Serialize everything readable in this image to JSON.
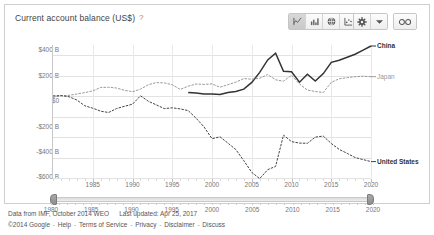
{
  "header": {
    "chart_title": "Current account balance (US$)",
    "help_icon": "question-mark-icon",
    "toolbar": {
      "chart_types": [
        {
          "name": "line-chart-icon",
          "label": "Line chart",
          "selected": true
        },
        {
          "name": "bar-chart-icon",
          "label": "Bar chart",
          "selected": false
        },
        {
          "name": "map-chart-icon",
          "label": "Map",
          "selected": false
        },
        {
          "name": "scatter-chart-icon",
          "label": "Scatter chart",
          "selected": false
        }
      ],
      "settings_icon": "gear-icon",
      "settings_caret": "chevron-down-icon",
      "link_icon": "link-icon"
    }
  },
  "chart_data": {
    "type": "line",
    "title": "Current account balance (US$)",
    "xlabel": "",
    "ylabel": "",
    "xlim": [
      1980,
      2020
    ],
    "ylim": [
      -800,
      500
    ],
    "grid": true,
    "legend_position": "right-inline",
    "y_ticks": [
      "$400 B",
      "$200 B",
      "$0",
      "-$200 B",
      "-$400 B",
      "-$600 B",
      "-$800 B"
    ],
    "y_tick_values": [
      400,
      200,
      0,
      -200,
      -400,
      -600,
      -800
    ],
    "x_ticks": [
      "1985",
      "1990",
      "1995",
      "2000",
      "2005",
      "2010",
      "2015",
      "2020"
    ],
    "x_tick_values": [
      1985,
      1990,
      1995,
      2000,
      2005,
      2010,
      2015,
      2020
    ],
    "unit": "US$ billions",
    "series": [
      {
        "name": "China",
        "color": "#333333",
        "style": "solid",
        "label_bold": true,
        "x": [
          1997,
          1998,
          1999,
          2000,
          2001,
          2002,
          2003,
          2004,
          2005,
          2006,
          2007,
          2008,
          2009,
          2010,
          2011,
          2012,
          2013,
          2014,
          2015,
          2016,
          2017,
          2018,
          2019,
          2020
        ],
        "values": [
          37,
          31,
          21,
          21,
          17,
          35,
          46,
          69,
          134,
          232,
          354,
          420,
          243,
          238,
          136,
          215,
          148,
          220,
          330,
          350,
          380,
          410,
          450,
          490
        ]
      },
      {
        "name": "Japan",
        "color": "#999999",
        "style": "dashed",
        "label_bold": false,
        "x": [
          1980,
          1981,
          1982,
          1983,
          1984,
          1985,
          1986,
          1987,
          1988,
          1989,
          1990,
          1991,
          1992,
          1993,
          1994,
          1995,
          1996,
          1997,
          1998,
          1999,
          2000,
          2001,
          2002,
          2003,
          2004,
          2005,
          2006,
          2007,
          2008,
          2009,
          2010,
          2011,
          2012,
          2013,
          2014,
          2015,
          2016,
          2017,
          2018,
          2019,
          2020
        ],
        "values": [
          -11,
          4,
          7,
          21,
          35,
          51,
          86,
          87,
          80,
          57,
          44,
          68,
          112,
          132,
          130,
          111,
          66,
          97,
          119,
          115,
          120,
          88,
          112,
          136,
          172,
          166,
          175,
          212,
          160,
          146,
          204,
          119,
          59,
          45,
          36,
          135,
          170,
          180,
          190,
          195,
          190
        ]
      },
      {
        "name": "United States",
        "color": "#444444",
        "style": "dashed",
        "label_bold": true,
        "x": [
          1980,
          1981,
          1982,
          1983,
          1984,
          1985,
          1986,
          1987,
          1988,
          1989,
          1990,
          1991,
          1992,
          1993,
          1994,
          1995,
          1996,
          1997,
          1998,
          1999,
          2000,
          2001,
          2002,
          2003,
          2004,
          2005,
          2006,
          2007,
          2008,
          2009,
          2010,
          2011,
          2012,
          2013,
          2014,
          2015,
          2016,
          2017,
          2018,
          2019,
          2020
        ],
        "values": [
          2,
          5,
          -5,
          -38,
          -94,
          -118,
          -147,
          -160,
          -121,
          -99,
          -79,
          3,
          -50,
          -85,
          -122,
          -114,
          -125,
          -141,
          -215,
          -301,
          -416,
          -397,
          -459,
          -521,
          -631,
          -745,
          -806,
          -719,
          -687,
          -381,
          -444,
          -459,
          -461,
          -400,
          -390,
          -463,
          -520,
          -560,
          -600,
          -620,
          -640
        ]
      }
    ]
  },
  "range_slider": {
    "start": "1980",
    "end": "2020",
    "ticks": [
      "1980",
      "1985",
      "1990",
      "1995",
      "2000",
      "2005",
      "2010",
      "2015",
      "2020"
    ],
    "left_handle": "range-start-handle",
    "right_handle": "range-end-handle"
  },
  "footer": {
    "source": "Data from IMF, October 2014 WEO",
    "last_updated": "Last updated: Apr 25, 2017",
    "copyright": "©2014 Google",
    "links": [
      "Help",
      "Terms of Service",
      "Privacy",
      "Disclaimer",
      "Discuss"
    ],
    "separator": "-"
  }
}
